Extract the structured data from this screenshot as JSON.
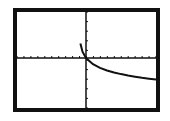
{
  "chart_data": {
    "type": "line",
    "title": "",
    "xlabel": "",
    "ylabel": "",
    "grid": false,
    "axes": {
      "x_ticks": 20,
      "y_ticks": 10
    },
    "xlim": [
      -10,
      10
    ],
    "ylim": [
      -10,
      10
    ],
    "series": [
      {
        "name": "f(x)",
        "x": [
          -0.8,
          -0.5,
          0,
          1,
          2,
          3,
          4,
          5,
          6,
          7,
          8,
          9,
          10
        ],
        "y": [
          1.6,
          0.7,
          0,
          -0.69,
          -1.1,
          -1.39,
          -1.61,
          -1.79,
          -1.95,
          -2.08,
          -2.2,
          -2.3,
          -2.4
        ]
      }
    ]
  },
  "colors": {
    "frame": "#111111",
    "plot": "#111111",
    "background": "#ffffff"
  }
}
